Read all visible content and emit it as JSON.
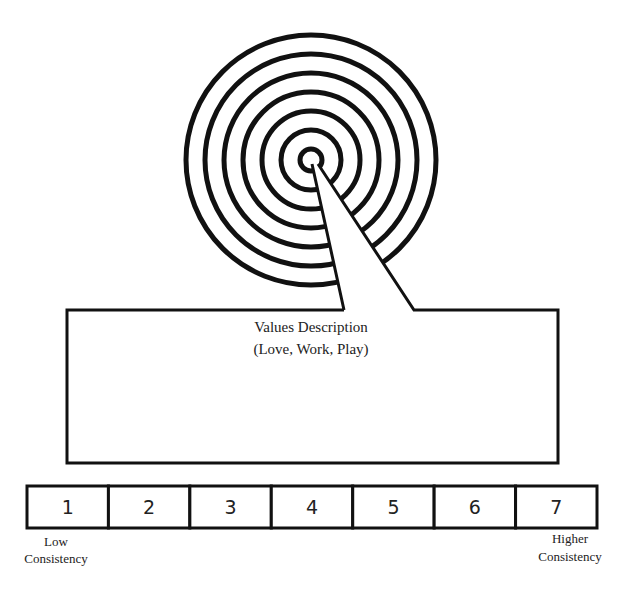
{
  "target": {
    "ring_count": 7
  },
  "callout": {
    "title": "Values Description",
    "subtitle": "(Love, Work, Play)"
  },
  "scale": {
    "cells": [
      "1",
      "2",
      "3",
      "4",
      "5",
      "6",
      "7"
    ],
    "low_label_line1": "Low",
    "low_label_line2": "Consistency",
    "high_label_line1": "Higher",
    "high_label_line2": "Consistency"
  },
  "colors": {
    "stroke": "#111111",
    "background": "#ffffff"
  }
}
